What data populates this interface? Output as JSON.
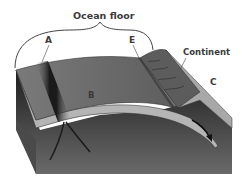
{
  "diagram": {
    "title": "Ocean floor",
    "labels": {
      "a": "A",
      "b": "B",
      "c": "C",
      "e": "E",
      "continent": "Continent"
    },
    "colors": {
      "ocean_floor_top": "#6b6b6b",
      "ridge": "#2a2a2a",
      "plate_edge": "#b8b8b8",
      "mantle": "#3a3a3a",
      "continent": "#5c5c5c",
      "continent_slope": "#a8a8a8",
      "background": "#ffffff"
    }
  }
}
